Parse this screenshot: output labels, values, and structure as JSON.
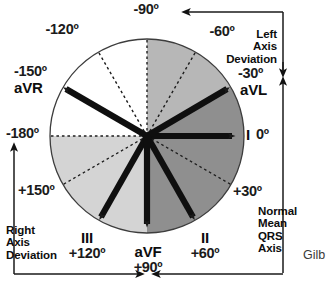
{
  "figure": {
    "title_text": "Hexaxial reference system — mean QRS axis",
    "signature": "Gilb"
  },
  "circle": {
    "center_x": 147,
    "center_y": 136,
    "radius": 97,
    "sectors": [
      {
        "name": "upper-left-white",
        "from": -180,
        "to": -90,
        "color": "#ffffff"
      },
      {
        "name": "upper-right-mid",
        "from": -90,
        "to": -30,
        "color": "#b4b4b4"
      },
      {
        "name": "right-dark",
        "from": -30,
        "to": 90,
        "color": "#8d8d8d"
      },
      {
        "name": "lower-left-light",
        "from": 90,
        "to": 180,
        "color": "#d2d2d2"
      }
    ]
  },
  "axes": {
    "vectors": [
      {
        "name": "lead-I",
        "label": "I",
        "degrees": 0,
        "deg_label": "0º"
      },
      {
        "name": "lead-II",
        "label": "II",
        "degrees": 60,
        "deg_label": "+60º"
      },
      {
        "name": "lead-III",
        "label": "III",
        "degrees": 120,
        "deg_label": "+120º"
      },
      {
        "name": "lead-aVR",
        "label": "aVR",
        "degrees": -150,
        "deg_label": "-150º"
      },
      {
        "name": "lead-aVL",
        "label": "aVL",
        "degrees": -30,
        "deg_label": "-30º"
      },
      {
        "name": "lead-aVF",
        "label": "aVF",
        "degrees": 90,
        "deg_label": "+90º"
      }
    ],
    "dashed_rays": [
      {
        "name": "ray-minus-180",
        "degrees": 180
      },
      {
        "name": "ray-minus-120",
        "degrees": -120
      },
      {
        "name": "ray-minus-90",
        "degrees": -90
      },
      {
        "name": "ray-minus-60",
        "degrees": -60
      },
      {
        "name": "ray-plus-30",
        "degrees": 30
      },
      {
        "name": "ray-plus-150",
        "degrees": 150
      }
    ]
  },
  "degree_labels": {
    "minus90": "-90º",
    "minus120": "-120º",
    "minus60": "-60º",
    "minus150": "-150º",
    "minus30": "-30º",
    "minus180": "-180º",
    "zero": "0º",
    "plus30": "+30º",
    "plus150": "+150º",
    "plus120": "+120º",
    "plus90": "+90º",
    "plus60": "+60º"
  },
  "lead_labels": {
    "aVR": "aVR",
    "aVL": "aVL",
    "I": "I",
    "II": "II",
    "III": "III",
    "aVF": "aVF"
  },
  "annotations": {
    "left_axis_deviation": "Left\nAxis\nDeviation",
    "right_axis_deviation": "Right\nAxis\nDeviation",
    "normal_mean_qrs_axis": "Normal\nMean\nQRS\nAxis"
  },
  "colors": {
    "stroke": "#111111",
    "sector_white": "#ffffff",
    "sector_mid": "#b4b4b4",
    "sector_dark": "#8d8d8d",
    "sector_light": "#d2d2d2",
    "outline": "#4a4a4a"
  }
}
